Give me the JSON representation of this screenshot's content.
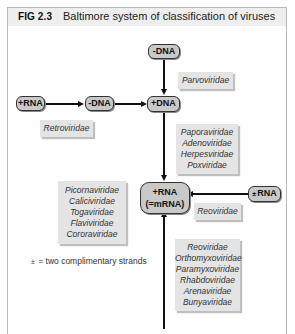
{
  "figure": {
    "label": "FIG 2.3",
    "title": "Baltimore system of classification of viruses"
  },
  "nodes": {
    "neg_dna_top": "-DNA",
    "pos_rna_left": "+RNA",
    "neg_dna_mid": "-DNA",
    "pos_dna": "+DNA",
    "mrna_line1": "+RNA",
    "mrna_line2": "(=mRNA)",
    "ds_rna_symbol": "±",
    "ds_rna_label": "RNA"
  },
  "families": {
    "parvo": [
      "Parvoviridae"
    ],
    "retro": [
      "Retroviridae"
    ],
    "dsdna": [
      "Paporaviridae",
      "Adenoviridae",
      "Herpesviridae",
      "Poxviridae"
    ],
    "pos_rna": [
      "Picornaviridae",
      "Caliciviridae",
      "Togaviridae",
      "Flaviviridae",
      "Cororaviridae"
    ],
    "dsrna": [
      "Reoviridae"
    ],
    "neg_rna": [
      "Reoviridae",
      "Orthomyxoviridae",
      "Paramyxoviridae",
      "Rhabdoviridae",
      "Arenaviridae",
      "Bunyaviridae"
    ]
  },
  "legend": {
    "symbol": "±",
    "text": "= two complimentary strands"
  }
}
